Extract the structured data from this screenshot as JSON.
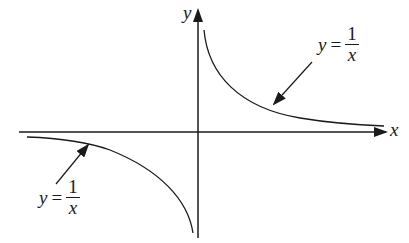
{
  "figure": {
    "axes": {
      "x_label": "x",
      "y_label": "y"
    },
    "annotations": [
      {
        "lhs": "y",
        "op": "=",
        "numerator": "1",
        "denominator": "x",
        "position": "upper-right"
      },
      {
        "lhs": "y",
        "op": "=",
        "numerator": "1",
        "denominator": "x",
        "position": "lower-left"
      }
    ],
    "colors": {
      "stroke": "#1a1a1a",
      "background": "#ffffff"
    }
  }
}
